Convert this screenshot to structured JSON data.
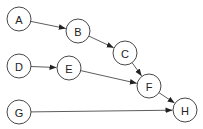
{
  "diagram": {
    "type": "directed-graph",
    "nodes": [
      {
        "id": "A",
        "label": "A",
        "x": 19,
        "y": 19
      },
      {
        "id": "B",
        "label": "B",
        "x": 78,
        "y": 31
      },
      {
        "id": "C",
        "label": "C",
        "x": 125,
        "y": 53
      },
      {
        "id": "D",
        "label": "D",
        "x": 19,
        "y": 66
      },
      {
        "id": "E",
        "label": "E",
        "x": 69,
        "y": 68
      },
      {
        "id": "F",
        "label": "F",
        "x": 149,
        "y": 86
      },
      {
        "id": "G",
        "label": "G",
        "x": 19,
        "y": 112
      },
      {
        "id": "H",
        "label": "H",
        "x": 185,
        "y": 110
      }
    ],
    "edges": [
      {
        "from": "A",
        "to": "B"
      },
      {
        "from": "B",
        "to": "C"
      },
      {
        "from": "C",
        "to": "F"
      },
      {
        "from": "D",
        "to": "E"
      },
      {
        "from": "E",
        "to": "F"
      },
      {
        "from": "F",
        "to": "H"
      },
      {
        "from": "G",
        "to": "H"
      }
    ],
    "node_radius": 12,
    "colors": {
      "stroke": "#333333",
      "fill": "#ffffff",
      "text": "#222222"
    }
  }
}
